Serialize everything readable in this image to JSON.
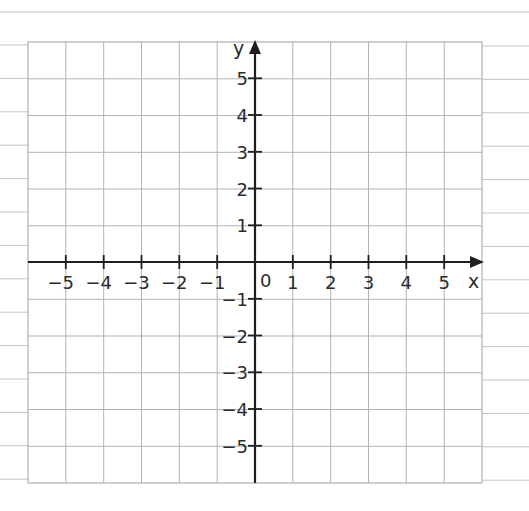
{
  "figure": {
    "type": "coordinate-grid",
    "axes": {
      "x_label": "x",
      "y_label": "y",
      "origin_label": "0",
      "x_ticks": [
        "−5",
        "−4",
        "−3",
        "−2",
        "−1",
        "1",
        "2",
        "3",
        "4",
        "5"
      ],
      "y_ticks": [
        "5",
        "4",
        "3",
        "2",
        "1",
        "−1",
        "−2",
        "−3",
        "−4",
        "−5"
      ],
      "x_range": [
        -6,
        6
      ],
      "y_range": [
        -6,
        6
      ]
    },
    "grid": {
      "columns": 12,
      "rows": 12,
      "line_color": "#b5b5b5",
      "axis_color": "#1e1e1e"
    },
    "ruled_paper": {
      "line_color": "#bdbdbd"
    }
  }
}
